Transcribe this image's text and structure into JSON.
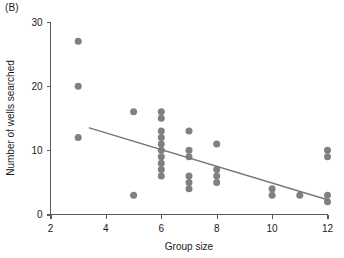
{
  "figure": {
    "panel_label": "(B)",
    "background_color": "#ffffff"
  },
  "chart_data": {
    "type": "scatter",
    "title": "",
    "panel": "(B)",
    "xlabel": "Group size",
    "ylabel": "Number of wells searched",
    "xlim": [
      2,
      12
    ],
    "ylim": [
      0,
      30
    ],
    "xticks": [
      2,
      4,
      6,
      8,
      10,
      12
    ],
    "xtick_labels": [
      "2",
      "4",
      "6",
      "8",
      "10",
      "12"
    ],
    "yticks": [
      0,
      10,
      20,
      30
    ],
    "ytick_labels": [
      "0",
      "10",
      "20",
      "30"
    ],
    "grid": false,
    "legend": null,
    "marker": {
      "shape": "circle",
      "color": "#808080",
      "size_px": 7
    },
    "points": [
      {
        "x": 3,
        "y": 27
      },
      {
        "x": 3,
        "y": 20
      },
      {
        "x": 3,
        "y": 12
      },
      {
        "x": 5,
        "y": 16
      },
      {
        "x": 5,
        "y": 3
      },
      {
        "x": 6,
        "y": 16
      },
      {
        "x": 6,
        "y": 15
      },
      {
        "x": 6,
        "y": 13
      },
      {
        "x": 6,
        "y": 12
      },
      {
        "x": 6,
        "y": 11
      },
      {
        "x": 6,
        "y": 10
      },
      {
        "x": 6,
        "y": 9
      },
      {
        "x": 6,
        "y": 8
      },
      {
        "x": 6,
        "y": 7
      },
      {
        "x": 6,
        "y": 6
      },
      {
        "x": 7,
        "y": 13
      },
      {
        "x": 7,
        "y": 10
      },
      {
        "x": 7,
        "y": 9
      },
      {
        "x": 7,
        "y": 6
      },
      {
        "x": 7,
        "y": 5
      },
      {
        "x": 7,
        "y": 4
      },
      {
        "x": 8,
        "y": 11
      },
      {
        "x": 8,
        "y": 7
      },
      {
        "x": 8,
        "y": 6
      },
      {
        "x": 8,
        "y": 5
      },
      {
        "x": 10,
        "y": 4
      },
      {
        "x": 10,
        "y": 3
      },
      {
        "x": 11,
        "y": 3
      },
      {
        "x": 12,
        "y": 10
      },
      {
        "x": 12,
        "y": 9
      },
      {
        "x": 12,
        "y": 3
      },
      {
        "x": 12,
        "y": 2
      }
    ],
    "trendline": {
      "type": "linear",
      "color": "#767676",
      "x_start": 3.4,
      "y_start": 13.5,
      "x_end": 12.0,
      "y_end": 2.3
    }
  }
}
